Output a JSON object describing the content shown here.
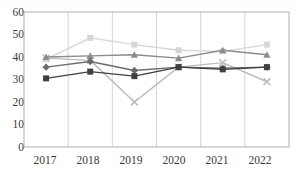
{
  "chart_data": {
    "type": "line",
    "title": "",
    "subtitle": "",
    "xlabel": "",
    "ylabel": "",
    "categories": [
      "2017",
      "2018",
      "2019",
      "2020",
      "2021",
      "2022"
    ],
    "ylim": [
      0,
      60
    ],
    "yticks": [
      0,
      10,
      20,
      30,
      40,
      50,
      60
    ],
    "grid": "vertical-only",
    "legend": "none",
    "series": [
      {
        "name": "Series 1",
        "marker": "square",
        "color": "#d6d6d6",
        "values": [
          39.0,
          48.5,
          45.5,
          43.0,
          42.5,
          45.5
        ]
      },
      {
        "name": "Series 2",
        "marker": "triangle",
        "color": "#8c8c8c",
        "values": [
          40.0,
          40.5,
          41.0,
          39.5,
          43.0,
          41.0
        ]
      },
      {
        "name": "Series 3",
        "marker": "x",
        "color": "#bdbdbd",
        "values": [
          39.5,
          38.5,
          20.0,
          35.5,
          37.5,
          29.0
        ]
      },
      {
        "name": "Series 4",
        "marker": "diamond",
        "color": "#6b6b6b",
        "values": [
          35.5,
          38.0,
          34.0,
          35.5,
          35.0,
          35.5
        ]
      },
      {
        "name": "Series 5",
        "marker": "square",
        "color": "#3f3f3f",
        "values": [
          30.5,
          33.5,
          31.5,
          35.5,
          34.5,
          35.5
        ]
      }
    ]
  },
  "axis": {
    "y_labels": [
      "60",
      "50",
      "40",
      "30",
      "20",
      "10",
      "0"
    ],
    "x_labels": [
      "2017",
      "2018",
      "2019",
      "2020",
      "2021",
      "2022"
    ]
  },
  "colors": {
    "axis_line": "#a6a6a6",
    "gridline": "#c9c9c9",
    "tick_text": "#3a3a3a",
    "background": "#ffffff"
  }
}
